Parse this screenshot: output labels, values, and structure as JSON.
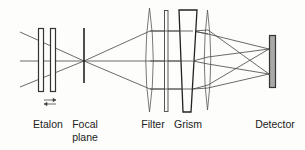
{
  "diagram": {
    "type": "optical-layout",
    "labels": {
      "etalon": "Etalon",
      "focal_plane_line1": "Focal",
      "focal_plane_line2": "plane",
      "filter": "Filter",
      "grism": "Grism",
      "detector": "Detector"
    },
    "components": [
      "etalon",
      "focal-plane",
      "lens-1",
      "filter",
      "grism",
      "lens-2",
      "detector"
    ],
    "colors": {
      "line": "#333333",
      "detector_fill": "#a8a8a8",
      "background": "#fdfdfb"
    }
  }
}
